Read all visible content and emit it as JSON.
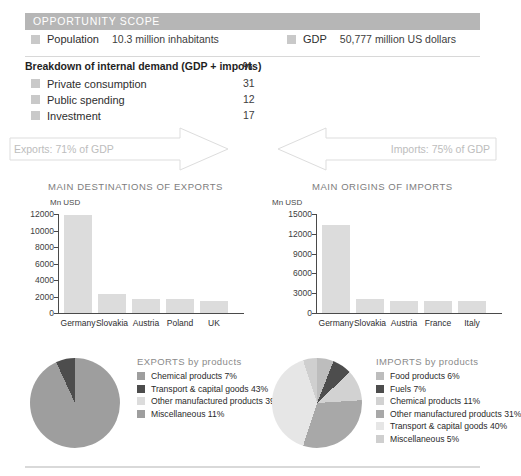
{
  "header": {
    "title": "OPPORTUNITY SCOPE",
    "bar_color": "#b6b6b6"
  },
  "facts": [
    {
      "label": "Population",
      "value": "10.3 million inhabitants"
    },
    {
      "label": "GDP",
      "value": "50,777 million US dollars"
    }
  ],
  "breakdown": {
    "title": "Breakdown of internal demand (GDP + imports)",
    "unit": "%",
    "rows": [
      {
        "label": "Private consumption",
        "value": "31"
      },
      {
        "label": "Public spending",
        "value": "12"
      },
      {
        "label": "Investment",
        "value": "17"
      }
    ]
  },
  "flows": {
    "exports_label": "Exports: 71% of GDP",
    "imports_label": "Imports: 75% of GDP"
  },
  "sections": {
    "exports_title": "MAIN DESTINATIONS OF EXPORTS",
    "imports_title": "MAIN ORIGINS OF IMPORTS"
  },
  "chart_data": [
    {
      "type": "bar",
      "title": "MAIN DESTINATIONS OF EXPORTS",
      "xlabel": "",
      "ylabel": "Mn USD",
      "ylim": [
        0,
        12000
      ],
      "yticks": [
        0,
        2000,
        4000,
        6000,
        8000,
        10000,
        12000
      ],
      "ytick_labels": [
        "0",
        "2000",
        "4000",
        "6000",
        "8000",
        "10000",
        "12000"
      ],
      "grid": false,
      "legend": "none",
      "bar_color": "#dcdcdc",
      "categories": [
        "Germany",
        "Slovakia",
        "Austria",
        "Poland",
        "UK"
      ],
      "values": [
        11900,
        2250,
        1750,
        1750,
        1450
      ]
    },
    {
      "type": "bar",
      "title": "MAIN ORIGINS OF IMPORTS",
      "xlabel": "",
      "ylabel": "Mn USD",
      "ylim": [
        0,
        15000
      ],
      "yticks": [
        0,
        3000,
        6000,
        9000,
        12000,
        15000
      ],
      "ytick_labels": [
        "0",
        "3000",
        "6000",
        "9000",
        "12000",
        "15000"
      ],
      "grid": false,
      "legend": "none",
      "bar_color": "#dcdcdc",
      "categories": [
        "Germany",
        "Slovakia",
        "Austria",
        "France",
        "Italy"
      ],
      "values": [
        13400,
        2050,
        1850,
        1800,
        1850
      ]
    },
    {
      "type": "pie",
      "title": "EXPORTS by products",
      "legend": "right",
      "labels": [
        "Chemical products 7%",
        "Transport & capital goods 43%",
        "Other manufactured products 39%",
        "Miscellaneous 11%"
      ],
      "categories": [
        "Chemical products",
        "Transport & capital goods",
        "Other manufactured products",
        "Miscellaneous"
      ],
      "values": [
        7,
        43,
        39,
        11
      ],
      "colors": [
        "#9e9e9e",
        "#4d4d4d",
        "#dcdcdc",
        "#9e9e9e"
      ]
    },
    {
      "type": "pie",
      "title": "IMPORTS by products",
      "legend": "right",
      "labels": [
        "Food products 6%",
        "Fuels 7%",
        "Chemical products 11%",
        "Other manufactured products 31%",
        "Transport & capital goods 40%",
        "Miscellaneous 5%"
      ],
      "categories": [
        "Food products",
        "Fuels",
        "Chemical products",
        "Other manufactured products",
        "Transport & capital goods",
        "Miscellaneous"
      ],
      "values": [
        6,
        7,
        11,
        31,
        40,
        5
      ],
      "colors": [
        "#bdbdbd",
        "#4d4d4d",
        "#d2d2d2",
        "#a8a8a8",
        "#e6e6e6",
        "#cfcfcf"
      ]
    }
  ]
}
